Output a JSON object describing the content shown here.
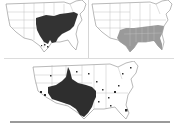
{
  "figure": {
    "panels": [
      {
        "id": "map-a",
        "description": "US map with dark shaded range across the eastern-central states",
        "fill_color": "#333333",
        "caption": ""
      },
      {
        "id": "map-b",
        "description": "US map with gray shaded range across the southeastern states",
        "fill_color": "#9a9a9a",
        "caption": ""
      },
      {
        "id": "map-c",
        "description": "US map with dark shaded range across the southwestern/south-central states plus scattered point records",
        "fill_color": "#2e2e2e",
        "caption": ""
      }
    ],
    "colors": {
      "state_lines": "#8a8a8a",
      "background": "#ffffff",
      "divider": "#9a9a9a"
    }
  }
}
